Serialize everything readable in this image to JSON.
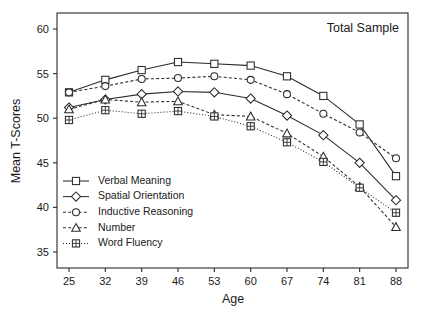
{
  "chart_data": {
    "type": "line",
    "title": "Total Sample",
    "xlabel": "Age",
    "ylabel": "Mean T-Scores",
    "categories": [
      25,
      32,
      39,
      46,
      53,
      60,
      67,
      74,
      81,
      88
    ],
    "x_tick_labels": [
      "25",
      "32",
      "39",
      "46",
      "53",
      "60",
      "67",
      "74",
      "81",
      "88"
    ],
    "y_tick_labels": [
      "35",
      "40",
      "45",
      "50",
      "55",
      "60"
    ],
    "y_ticks": [
      35,
      40,
      45,
      50,
      55,
      60
    ],
    "ylim": [
      33.2,
      61.8
    ],
    "grid": false,
    "legend_position": "lower-left-inside",
    "series": [
      {
        "name": "Verbal Meaning",
        "marker": "square",
        "line_style": "solid",
        "values": [
          52.9,
          54.3,
          55.4,
          56.3,
          56.1,
          55.9,
          54.7,
          52.5,
          49.3,
          43.5
        ]
      },
      {
        "name": "Spatial Orientation",
        "marker": "diamond",
        "line_style": "solid",
        "values": [
          51.2,
          52.1,
          52.7,
          53.0,
          52.9,
          52.2,
          50.3,
          48.1,
          45.0,
          40.8
        ]
      },
      {
        "name": "Inductive Reasoning",
        "marker": "circle",
        "line_style": "dashed",
        "values": [
          52.9,
          53.6,
          54.4,
          54.5,
          54.7,
          54.3,
          52.7,
          50.5,
          48.4,
          45.5
        ]
      },
      {
        "name": "Number",
        "marker": "triangle",
        "line_style": "dashed",
        "values": [
          51.0,
          52.1,
          51.8,
          51.9,
          50.4,
          50.2,
          48.3,
          45.7,
          42.3,
          37.8
        ]
      },
      {
        "name": "Word Fluency",
        "marker": "plus-square",
        "line_style": "dotted",
        "values": [
          49.8,
          50.9,
          50.5,
          50.8,
          50.2,
          49.1,
          47.3,
          45.1,
          42.2,
          39.4
        ]
      }
    ]
  },
  "colors": {
    "ink": "#2b2b2b",
    "background": "#ffffff"
  }
}
